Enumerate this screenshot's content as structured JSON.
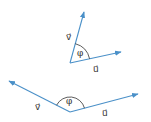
{
  "diagram": {
    "title": "",
    "colors": {
      "vector": "#4a90c8",
      "arc": "#333333",
      "text": "#333333"
    },
    "figures": [
      {
        "id": "acute",
        "angle_label": "φ",
        "vectors": [
          {
            "name": "v",
            "label": "v⃗"
          },
          {
            "name": "u",
            "label": "u⃗"
          }
        ]
      },
      {
        "id": "obtuse",
        "angle_label": "φ",
        "vectors": [
          {
            "name": "v",
            "label": "v⃗"
          },
          {
            "name": "u",
            "label": "u⃗"
          }
        ]
      }
    ]
  }
}
